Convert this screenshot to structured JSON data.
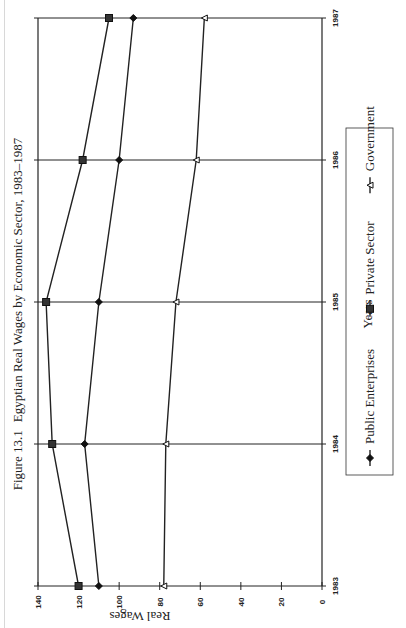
{
  "figure": {
    "label": "Figure 13.1",
    "title": "Egyptian Real Wages by Economic Sector, 1983–1987"
  },
  "chart_data": {
    "type": "line",
    "title": "Egyptian Real Wages by Economic Sector, 1983–1987",
    "figure_label": "Figure 13.1",
    "xlabel": "Years",
    "ylabel": "Real Wages",
    "x": [
      "1983",
      "1984",
      "1985",
      "1986",
      "1987"
    ],
    "ylim": [
      0,
      140
    ],
    "yticks": [
      0,
      20,
      40,
      60,
      80,
      100,
      120,
      140
    ],
    "grid": "vertical lines at each year",
    "orientation": "page rotated 90 degrees counter-clockwise",
    "legend_position": "bottom",
    "series": [
      {
        "name": "Public Enterprises",
        "marker": "diamond-filled",
        "values": [
          110,
          117,
          110,
          100,
          93
        ]
      },
      {
        "name": "Private Sector",
        "marker": "square-filled",
        "values": [
          120,
          133,
          136,
          118,
          105
        ]
      },
      {
        "name": "Government",
        "marker": "triangle-open",
        "values": [
          78,
          77,
          72,
          62,
          58
        ]
      }
    ]
  }
}
